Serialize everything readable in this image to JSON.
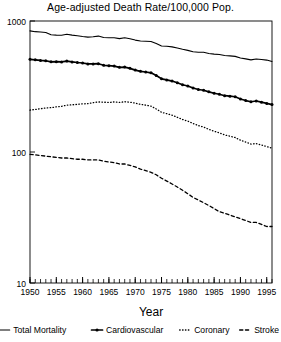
{
  "chart_data": {
    "type": "line",
    "title": "Age-adjusted Death Rate/100,000 Pop.",
    "xlabel": "Year",
    "ylabel": "",
    "yscale": "log",
    "ylim": [
      10,
      1000
    ],
    "xlim": [
      1950,
      1996
    ],
    "grid": false,
    "legend_position": "bottom",
    "ytick_labels": [
      "1000",
      "100",
      "10"
    ],
    "ytick_values": [
      1000,
      100,
      10
    ],
    "xtick_labels": [
      "1950",
      "1955",
      "1960",
      "1965",
      "1970",
      "1975",
      "1980",
      "1985",
      "1990",
      "1995"
    ],
    "xtick_values": [
      1950,
      1955,
      1960,
      1965,
      1970,
      1975,
      1980,
      1985,
      1990,
      1995
    ],
    "minor_xticks": "every 1 year",
    "x": [
      1950,
      1951,
      1952,
      1953,
      1954,
      1955,
      1956,
      1957,
      1958,
      1959,
      1960,
      1961,
      1962,
      1963,
      1964,
      1965,
      1966,
      1967,
      1968,
      1969,
      1970,
      1971,
      1972,
      1973,
      1974,
      1975,
      1976,
      1977,
      1978,
      1979,
      1980,
      1981,
      1982,
      1983,
      1984,
      1985,
      1986,
      1987,
      1988,
      1989,
      1990,
      1991,
      1992,
      1993,
      1994,
      1995,
      1996
    ],
    "series": [
      {
        "name": "Total Mortality",
        "style": "solid",
        "color": "#000000",
        "values": [
          841,
          829,
          824,
          818,
          785,
          780,
          779,
          793,
          780,
          771,
          761,
          753,
          758,
          767,
          748,
          744,
          745,
          734,
          744,
          731,
          715,
          704,
          701,
          698,
          674,
          645,
          641,
          635,
          623,
          608,
          597,
          583,
          577,
          577,
          565,
          559,
          555,
          545,
          542,
          537,
          522,
          514,
          505,
          513,
          508,
          503,
          491
        ]
      },
      {
        "name": "Cardiovascular",
        "style": "solid-markers",
        "color": "#000000",
        "values": [
          510,
          505,
          500,
          497,
          488,
          489,
          487,
          494,
          487,
          482,
          478,
          470,
          470,
          472,
          459,
          456,
          453,
          443,
          445,
          435,
          422,
          413,
          408,
          402,
          383,
          362,
          355,
          348,
          338,
          326,
          319,
          308,
          300,
          296,
          288,
          281,
          276,
          269,
          267,
          264,
          254,
          247,
          242,
          245,
          240,
          235,
          230
        ]
      },
      {
        "name": "Coronary",
        "style": "dotted",
        "color": "#000000",
        "values": [
          209,
          211,
          214,
          217,
          218,
          221,
          223,
          228,
          229,
          231,
          233,
          234,
          238,
          241,
          240,
          239,
          241,
          239,
          242,
          240,
          236,
          231,
          228,
          224,
          213,
          201,
          196,
          191,
          184,
          177,
          172,
          165,
          159,
          155,
          149,
          144,
          140,
          135,
          132,
          129,
          123,
          119,
          115,
          116,
          113,
          110,
          107
        ]
      },
      {
        "name": "Stroke",
        "style": "dashed",
        "color": "#000000",
        "values": [
          96,
          95,
          94,
          93,
          92,
          91,
          90,
          90,
          89,
          88,
          88,
          87,
          87,
          87,
          85,
          84,
          83,
          81,
          81,
          79,
          77,
          74,
          72,
          70,
          67,
          63,
          60,
          57,
          54,
          51,
          48,
          45,
          43,
          41,
          39,
          37,
          35,
          34,
          33,
          32,
          31,
          30,
          29,
          29,
          28,
          27,
          27
        ]
      }
    ]
  },
  "legend": {
    "items": [
      {
        "label": "Total Mortality",
        "style": "solid"
      },
      {
        "label": "Cardiovascular",
        "style": "solid-markers"
      },
      {
        "label": "Coronary",
        "style": "dotted"
      },
      {
        "label": "Stroke",
        "style": "dashed"
      }
    ]
  },
  "colors": {
    "ink": "#000000",
    "background": "#ffffff"
  }
}
